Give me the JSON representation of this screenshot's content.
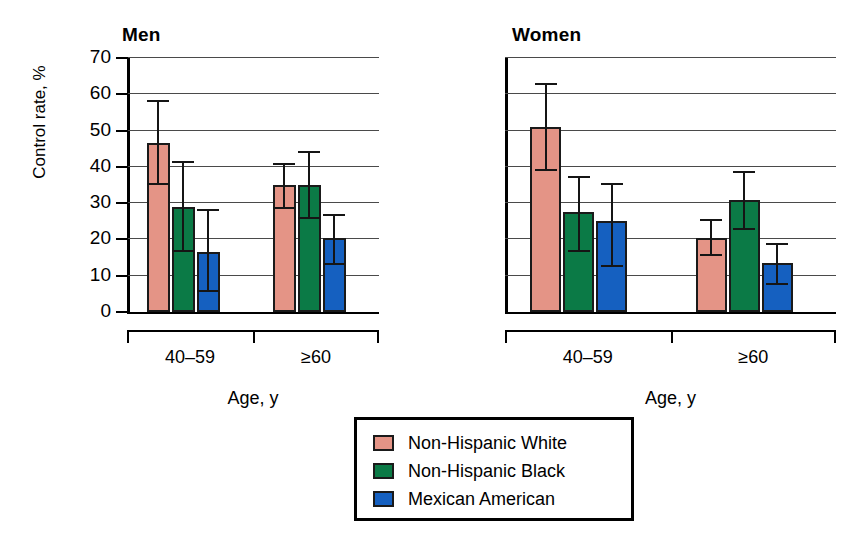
{
  "figure": {
    "ylabel": "Control rate, %",
    "xlabel_men": "Age, y",
    "xlabel_women": "Age, y",
    "panels": [
      {
        "key": "men",
        "title": "Men"
      },
      {
        "key": "women",
        "title": "Women"
      }
    ],
    "ytick_labels": [
      "70",
      "60",
      "50",
      "40",
      "30",
      "20",
      "10",
      "0"
    ],
    "xtick_labels": [
      "40–59",
      "≥60"
    ]
  },
  "legend": {
    "items": [
      {
        "label": "Non-Hispanic White",
        "color": "#E49486"
      },
      {
        "label": "Non-Hispanic Black",
        "color": "#0B7A46"
      },
      {
        "label": "Mexican American",
        "color": "#1560C0"
      }
    ]
  },
  "colors": {
    "non_hispanic_white": "#E49486",
    "non_hispanic_black": "#0B7A46",
    "mexican_american": "#1560C0",
    "axis": "#000000",
    "gridline": "#4a4a4a",
    "bar_outline": "#1a1a1a"
  },
  "chart_data": {
    "type": "bar",
    "xlabel": "Age, y",
    "ylabel": "Control rate, %",
    "ylim": [
      0,
      70
    ],
    "ytick_step": 10,
    "grid": true,
    "legend_position": "bottom-center",
    "error_bars": "95% confidence interval",
    "panels": [
      {
        "name": "Men",
        "categories": [
          "40–59",
          "≥60"
        ],
        "series": [
          {
            "name": "Non-Hispanic White",
            "color": "#E49486",
            "values": [
              46.5,
              35.0
            ],
            "lower": [
              35.0,
              28.5
            ],
            "upper": [
              58.5,
              41.0
            ]
          },
          {
            "name": "Non-Hispanic Black",
            "color": "#0B7A46",
            "values": [
              29.0,
              35.0
            ],
            "lower": [
              16.5,
              25.5
            ],
            "upper": [
              41.5,
              44.5
            ]
          },
          {
            "name": "Mexican American",
            "color": "#1560C0",
            "values": [
              16.5,
              20.5
            ],
            "lower": [
              5.5,
              13.0
            ],
            "upper": [
              28.5,
              27.0
            ]
          }
        ]
      },
      {
        "name": "Women",
        "categories": [
          "40–59",
          "≥60"
        ],
        "series": [
          {
            "name": "Non-Hispanic White",
            "color": "#E49486",
            "values": [
              51.0,
              20.5
            ],
            "lower": [
              39.0,
              15.5
            ],
            "upper": [
              63.0,
              25.5
            ]
          },
          {
            "name": "Non-Hispanic Black",
            "color": "#0B7A46",
            "values": [
              27.5,
              31.0
            ],
            "lower": [
              16.5,
              22.5
            ],
            "upper": [
              37.5,
              39.0
            ]
          },
          {
            "name": "Mexican American",
            "color": "#1560C0",
            "values": [
              25.0,
              13.5
            ],
            "lower": [
              12.5,
              7.5
            ],
            "upper": [
              35.5,
              19.0
            ]
          }
        ]
      }
    ]
  }
}
